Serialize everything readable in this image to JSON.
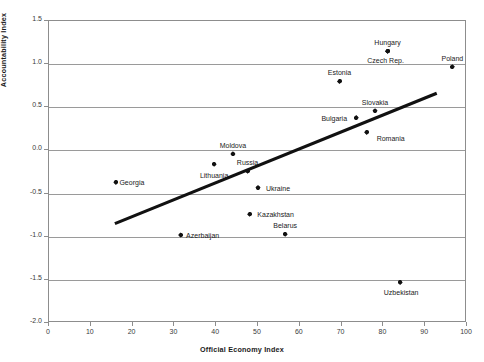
{
  "chart_data": {
    "type": "scatter",
    "title": "",
    "xlabel": "Official Economy Index",
    "ylabel": "Accountability Index",
    "xlim": [
      0,
      100
    ],
    "ylim": [
      -2.0,
      1.5
    ],
    "xticks": [
      0,
      10,
      20,
      30,
      40,
      50,
      60,
      70,
      80,
      90,
      100
    ],
    "yticks": [
      1.5,
      1.0,
      0.5,
      0.0,
      -0.5,
      -1.0,
      -1.5,
      -2.0
    ],
    "xtick_labels": [
      "0",
      "10",
      "20",
      "30",
      "40",
      "50",
      "60",
      "70",
      "80",
      "90",
      "100"
    ],
    "ytick_labels": [
      "1.5",
      "1.0",
      "0.5",
      "0.0",
      "-0.5",
      "-1.0",
      "-1.5",
      "-2.0"
    ],
    "grid": true,
    "grid_axis": "y",
    "legend": "none",
    "marker": "diamond",
    "marker_color": "#111111",
    "points": [
      {
        "label": "Georgia",
        "x": 16.0,
        "y": -0.37,
        "label_dx": 16,
        "label_dy": 0
      },
      {
        "label": "Azerbaijan",
        "x": 31.5,
        "y": -0.98,
        "label_dx": 22,
        "label_dy": 0
      },
      {
        "label": "Lithuania",
        "x": 39.5,
        "y": -0.16,
        "label_dx": 0,
        "label_dy": 11
      },
      {
        "label": "Moldova",
        "x": 44.0,
        "y": -0.04,
        "label_dx": 0,
        "label_dy": -9
      },
      {
        "label": "Russia",
        "x": 47.5,
        "y": -0.24,
        "label_dx": 0,
        "label_dy": -9
      },
      {
        "label": "Kazakhstan",
        "x": 48.0,
        "y": -0.74,
        "label_dx": 26,
        "label_dy": 0
      },
      {
        "label": "Ukraine",
        "x": 50.0,
        "y": -0.43,
        "label_dx": 20,
        "label_dy": 0.5
      },
      {
        "label": "Belarus",
        "x": 56.5,
        "y": -0.97,
        "label_dx": 0,
        "label_dy": -9
      },
      {
        "label": "Estonia",
        "x": 69.5,
        "y": 0.8,
        "label_dx": 0,
        "label_dy": -9
      },
      {
        "label": "Bulgaria",
        "x": 73.5,
        "y": 0.38,
        "label_dx": -22,
        "label_dy": 0
      },
      {
        "label": "Romania",
        "x": 76.0,
        "y": 0.21,
        "label_dx": 24,
        "label_dy": 5.5
      },
      {
        "label": "Slovakia",
        "x": 78.0,
        "y": 0.46,
        "label_dx": 0,
        "label_dy": -9
      },
      {
        "label": "Hungary",
        "x": 81.0,
        "y": 1.15,
        "label_dx": 0,
        "label_dy": -9
      },
      {
        "label": "Czech Rep.",
        "x": 81.0,
        "y": 1.15,
        "label_dx": -2,
        "label_dy": 9
      },
      {
        "label": "Uzbekistan",
        "x": 84.0,
        "y": -1.53,
        "label_dx": 1,
        "label_dy": 10
      },
      {
        "label": "Poland",
        "x": 96.5,
        "y": 0.97,
        "label_dx": 0,
        "label_dy": -9
      }
    ],
    "trendline": {
      "x_start": 16.0,
      "y_start": -0.86,
      "x_end": 93.0,
      "y_end": 0.65,
      "color": "#111111",
      "width": 3.2
    }
  }
}
